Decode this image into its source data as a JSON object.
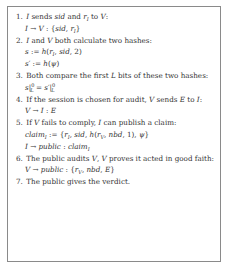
{
  "figure": {
    "steps": [
      {
        "number": "1.",
        "text": "I sends sid and r_I to V:",
        "formula": "I → V : {sid, r_I}"
      },
      {
        "number": "2.",
        "text": "I and V both calculate two hashes:",
        "formulas": [
          "s := h(r_I, sid, 2)",
          "s' := h(ψ)"
        ]
      },
      {
        "number": "3.",
        "text": "Both compare the first L bits of these two hashes:",
        "formula": "s|_L^0 = s'|_L^0"
      },
      {
        "number": "4.",
        "text": "If the session is chosen for audit, V sends E to I:",
        "formula": "V → I : E"
      },
      {
        "number": "5.",
        "text": "If V fails to comply, I can publish a claim:",
        "formulas": [
          "claim_I := {r_I, sid, h(r_V, nbd, 1), ψ}",
          "I → public : claim_I"
        ]
      },
      {
        "number": "6.",
        "text": "The public audits V, V proves it acted in good faith:",
        "formula": "V → public : {r_V, nbd, E}"
      },
      {
        "number": "7.",
        "text": "The public gives the verdict."
      }
    ]
  }
}
